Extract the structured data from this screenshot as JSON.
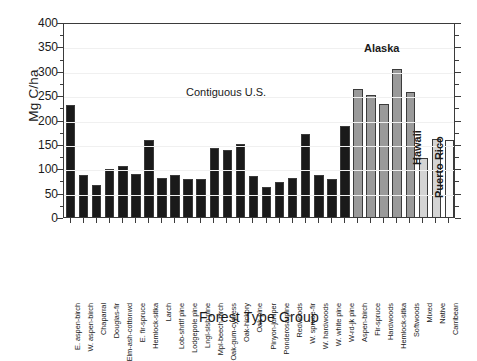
{
  "chart_data": {
    "type": "bar",
    "title": "",
    "xlabel": "Forest Type Group",
    "ylabel": "Mg C/ha",
    "ylim": [
      0,
      400
    ],
    "ytick_values": [
      0,
      50,
      100,
      150,
      200,
      250,
      300,
      350,
      400
    ],
    "ytick_labels": [
      "0",
      "50",
      "100",
      "150",
      "200",
      "250",
      "300",
      "350",
      "400"
    ],
    "yminor_step": 25,
    "grid": false,
    "legend": "none",
    "categories": [
      "E. aspen-birch",
      "W. aspen-birch",
      "Chaparral",
      "Douglas-fir",
      "Elm-ash-cottonwd",
      "E. fir-spruce",
      "Hemlock-sitka",
      "Larch",
      "Lob-shrtlf pine",
      "Lodgepole pine",
      "Lngl-slsh pine",
      "Mpl-beech-birch",
      "Oak-gum-cypress",
      "Oak-hickory",
      "Oak-pine",
      "Pinyon-juniper",
      "Ponderosa-pine",
      "Redwoods",
      "W. spruce-fir",
      "W. hardwoods",
      "W. white pine",
      "W-rd-jk pine",
      "Aspen-birch",
      "Fir-spruce",
      "Hardwoods",
      "Hemlock-sitka",
      "Softwoods",
      "Mixed",
      "Native",
      "Carribean"
    ],
    "values": [
      229,
      87,
      65,
      98,
      104,
      88,
      157,
      81,
      86,
      77,
      79,
      141,
      137,
      149,
      85,
      62,
      72,
      80,
      170,
      86,
      79,
      187,
      262,
      250,
      232,
      303,
      256,
      122,
      160,
      157
    ],
    "groups": [
      {
        "name": "Contiguous U.S.",
        "start_index": 0,
        "end_index": 21,
        "color": "#1a1a1a",
        "annotation_orientation": "horizontal"
      },
      {
        "name": "Alaska",
        "start_index": 22,
        "end_index": 26,
        "color": "#9a9a9a",
        "annotation_orientation": "horizontal"
      },
      {
        "name": "Hawaii",
        "start_index": 27,
        "end_index": 28,
        "color": "#d4d4d4",
        "annotation_orientation": "vertical"
      },
      {
        "name": "Puerto Rico",
        "start_index": 29,
        "end_index": 29,
        "color": "#fbfbfb",
        "annotation_orientation": "vertical"
      }
    ]
  },
  "annotations": {
    "contiguous_us": "Contiguous U.S.",
    "alaska": "Alaska",
    "hawaii": "Hawaii",
    "puerto_rico": "Puerto Rico"
  },
  "colors": {
    "contiguous_us_bar": "#1a1a1a",
    "alaska_bar": "#9a9a9a",
    "hawaii_bar": "#d4d4d4",
    "puerto_rico_bar": "#fbfbfb",
    "bar_edge": "#3b3b3b",
    "axis": "#3b3b3b",
    "text": "#1a1a1a",
    "background": "#ffffff"
  }
}
